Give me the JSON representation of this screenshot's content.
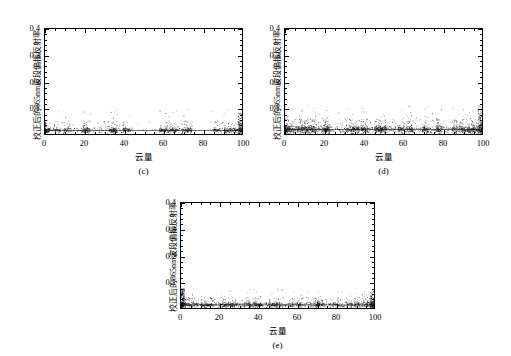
{
  "figure": {
    "background": "#ffffff",
    "ink": "#000000",
    "point_color": "#111111"
  },
  "axis": {
    "y_title": "校正后的865nm波段偏振反射率",
    "x_title": "云量",
    "y_ticks": [
      "0.1",
      "0.2",
      "0.3",
      "0.4"
    ],
    "y_tick_values": [
      0.1,
      0.2,
      0.3,
      0.4
    ],
    "x_ticks": [
      "0",
      "20",
      "40",
      "60",
      "80",
      "100"
    ],
    "x_tick_values": [
      0,
      20,
      40,
      60,
      80,
      100
    ],
    "y_min": 0.0,
    "y_max": 0.4,
    "x_min": 0,
    "x_max": 100,
    "y_minor_step": 0.02,
    "x_minor_step": 5
  },
  "panels": [
    {
      "id": "c",
      "label": "(c)",
      "y_title": "校正后的865nm波段偏振反射率",
      "x_title": "云量"
    },
    {
      "id": "d",
      "label": "(d)",
      "y_title": "校正后的865nm波段偏振反射率",
      "x_title": "云量"
    },
    {
      "id": "e",
      "label": "(e)",
      "y_title": "校正后的865nm波段偏振反射率",
      "x_title": "云量"
    }
  ],
  "chart_data": [
    {
      "type": "scatter",
      "panel": "c",
      "title": "(c)",
      "xlabel": "云量",
      "ylabel": "校正后的865nm波段偏振反射率",
      "xlim": [
        0,
        100
      ],
      "ylim": [
        0,
        0.4
      ],
      "grid": false,
      "legend": null,
      "marker": "dot",
      "n_points": 1600,
      "description": "Dense black point cloud pinned near y=0.005-0.03 across the full cloud-amount range, with a near-solid baseline band at y≈0.015. Sparse outliers rise to y≈0.09. Vertical striping from discrete cloud-fraction bins; notable sparse gaps around x=45-58 and x=75-85; denser clumps at x=0-2, 59-66, 70-74, 86-100.",
      "baseline_y": 0.015,
      "baseline_spread": 0.012,
      "outlier_max_y": 0.095,
      "cluster_centers_x": [
        0,
        1,
        6,
        11,
        20,
        21,
        34,
        35,
        41,
        59,
        62,
        65,
        71,
        73,
        87,
        92,
        95,
        98,
        100
      ],
      "sparse_gaps_x": [
        [
          45,
          58
        ],
        [
          75,
          85
        ]
      ]
    },
    {
      "type": "scatter",
      "panel": "d",
      "title": "(d)",
      "xlabel": "云量",
      "ylabel": "校正后的865nm波段偏振反射率",
      "xlim": [
        0,
        100
      ],
      "ylim": [
        0,
        0.4
      ],
      "grid": false,
      "legend": null,
      "marker": "dot",
      "n_points": 2600,
      "description": "Densest of the three panels. Heavy black band from y≈0.003 to y≈0.035 spanning all cloud amounts, with a continuous solid line at y≈0.018. Scattered outliers up to y≈0.11. Strongest concentrations at x=0-15, 20-22, 33-42, 47-52, 59-60, 85-100.",
      "baseline_y": 0.018,
      "baseline_spread": 0.017,
      "outlier_max_y": 0.11,
      "cluster_centers_x": [
        0,
        2,
        5,
        8,
        11,
        14,
        20,
        21,
        33,
        36,
        40,
        47,
        50,
        59,
        63,
        71,
        78,
        86,
        90,
        94,
        97,
        100
      ],
      "sparse_gaps_x": []
    },
    {
      "type": "scatter",
      "panel": "e",
      "title": "(e)",
      "xlabel": "云量",
      "ylabel": "校正后的865nm波段偏振反射率",
      "xlim": [
        0,
        100
      ],
      "ylim": [
        0,
        0.4
      ],
      "grid": false,
      "legend": null,
      "marker": "dot",
      "n_points": 1900,
      "description": "Point cloud compressed near the x-axis, y≈0.002-0.03, with a solid baseline at y≈0.013. A tall narrow column of points at x≈0 reaching y≈0.075. Outliers elsewhere reach y≈0.06. Dense clumps at x=0-3, 20-27, 33-40, 46-52, 70-72, 86-100.",
      "baseline_y": 0.013,
      "baseline_spread": 0.012,
      "outlier_max_y": 0.075,
      "cluster_centers_x": [
        0,
        1,
        3,
        7,
        12,
        15,
        21,
        24,
        27,
        34,
        37,
        40,
        47,
        50,
        57,
        61,
        70,
        72,
        80,
        87,
        91,
        95,
        98,
        100
      ],
      "sparse_gaps_x": []
    }
  ]
}
